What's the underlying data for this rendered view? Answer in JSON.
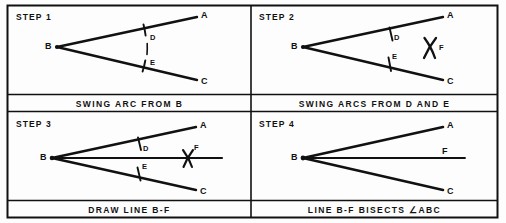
{
  "figure": {
    "ink_color": "#111111",
    "background_color": "#fdfdfd",
    "columns": 2,
    "rows": 2
  },
  "panels": [
    {
      "id": "step-1",
      "title": "STEP 1",
      "caption": "SWING ARC FROM B",
      "labels": {
        "vertex": "B",
        "ray_upper_end": "A",
        "ray_lower_end": "C",
        "arc_on_upper": "D",
        "arc_on_lower": "E"
      },
      "shows": "arc swung from vertex B cutting ray BA at D and ray BC at E"
    },
    {
      "id": "step-2",
      "title": "STEP 2",
      "caption": "SWING ARCS FROM D AND E",
      "labels": {
        "vertex": "B",
        "ray_upper_end": "A",
        "ray_lower_end": "C",
        "arc_on_upper": "D",
        "arc_on_lower": "E",
        "intersection": "F"
      },
      "shows": "two arcs swung from D and from E crossing at point F"
    },
    {
      "id": "step-3",
      "title": "STEP 3",
      "caption": "DRAW LINE B-F",
      "labels": {
        "vertex": "B",
        "ray_upper_end": "A",
        "ray_lower_end": "C",
        "arc_on_upper": "D",
        "arc_on_lower": "E",
        "intersection": "F"
      },
      "shows": "straight line drawn from vertex B through intersection point F"
    },
    {
      "id": "step-4",
      "title": "STEP 4",
      "caption": "LINE B-F BISECTS ∠ABC",
      "labels": {
        "vertex": "B",
        "ray_upper_end": "A",
        "ray_lower_end": "C",
        "bisector_end": "F"
      },
      "shows": "completed bisector line B-F dividing angle ABC into two equal angles"
    }
  ]
}
